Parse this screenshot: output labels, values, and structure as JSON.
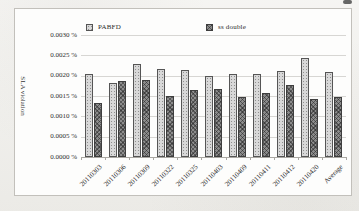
{
  "figure": {
    "background": "#fdfdfc",
    "border_color": "#c2c0bb"
  },
  "legend": {
    "items": [
      {
        "label": "PABFD",
        "swatch_color": "#d8d8d8",
        "swatch_pattern": "dots"
      },
      {
        "label": "ss double",
        "swatch_color": "#8c8c8c",
        "swatch_pattern": "crosshatch"
      }
    ]
  },
  "y_axis": {
    "title": "SLA violation",
    "tick_labels": [
      "0.0030 %",
      "0.0025 %",
      "0.0020 %",
      "0.0015 %",
      "0.0010 %",
      "0.0005 %",
      "0.0000 %"
    ]
  },
  "chart_data": {
    "type": "bar",
    "title": "",
    "categories": [
      "20110303",
      "20110306",
      "20110309",
      "20110322",
      "20110325",
      "20110403",
      "20110409",
      "20110411",
      "20110412",
      "20110420",
      "Average"
    ],
    "series": [
      {
        "name": "PABFD",
        "color": "#d8d8d8",
        "pattern": "dots",
        "values": [
          0.00205,
          0.00182,
          0.00228,
          0.00216,
          0.00213,
          0.00198,
          0.00203,
          0.00205,
          0.00211,
          0.00243,
          0.00209
        ]
      },
      {
        "name": "ss double",
        "color": "#8c8c8c",
        "pattern": "crosshatch",
        "values": [
          0.00134,
          0.00186,
          0.0019,
          0.00149,
          0.00164,
          0.00167,
          0.00148,
          0.00157,
          0.00177,
          0.00142,
          0.00147
        ]
      }
    ],
    "xlabel": "",
    "ylabel": "SLA violation",
    "ylim": [
      0,
      0.003
    ],
    "ytick_step": 0.0005,
    "ytick_format": "0.0000 %",
    "grid": true,
    "legend_position": "top"
  }
}
